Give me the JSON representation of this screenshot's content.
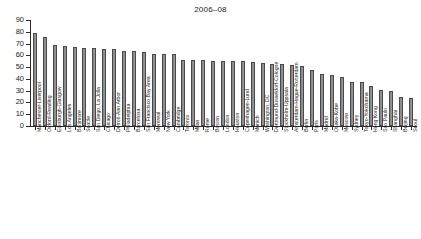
{
  "chart_data": {
    "type": "bar",
    "title": "2006–08",
    "xlabel": "",
    "ylabel": "",
    "ylim": [
      0,
      90
    ],
    "yticks": [
      0,
      10,
      20,
      30,
      40,
      50,
      60,
      70,
      80,
      90
    ],
    "grid": false,
    "legend": null,
    "bar_color": "#8d8d8d",
    "bar_edge_color": "#4a4a4a",
    "categories": [
      "Manchester-Liverpool",
      "Oxford-Reading",
      "Edinburgh-Glasgow",
      "Los Angeles",
      "Baltimore",
      "Seattle",
      "San Diego, La Jolla",
      "Chicago",
      "Detroit-Ann Arbor",
      "Philadelphia",
      "Barcelona",
      "San Francisco Bay Area",
      "Montreal",
      "New York",
      "Cambridge",
      "Toronto",
      "Milan",
      "Rome",
      "Boston",
      "London",
      "Houston",
      "Copenhagen-Lund",
      "Munich",
      "Washington, DC",
      "Dortmund-Düsseldorf-Cologne",
      "Stockholm-Uppsala",
      "Amsterdam-Hague-Rotterdam",
      "Berlin",
      "Paris",
      "Madrid",
      "Osaka-Kobe",
      "Moscow",
      "Sydney",
      "Tokyo-Yokohama",
      "Hong Kong",
      "Sao Paulo",
      "Shanghai",
      "Beijing",
      "Seoul"
    ],
    "values": [
      79,
      75.5,
      69,
      68,
      67.5,
      66.5,
      66,
      65.5,
      65,
      63.5,
      63.5,
      63,
      61.5,
      61,
      61,
      56,
      56,
      56,
      55,
      55,
      55,
      55,
      54.5,
      53.5,
      53,
      52.5,
      52,
      51,
      47.5,
      44,
      43.5,
      42,
      37.5,
      37,
      34,
      30.5,
      30,
      25,
      24
    ]
  }
}
